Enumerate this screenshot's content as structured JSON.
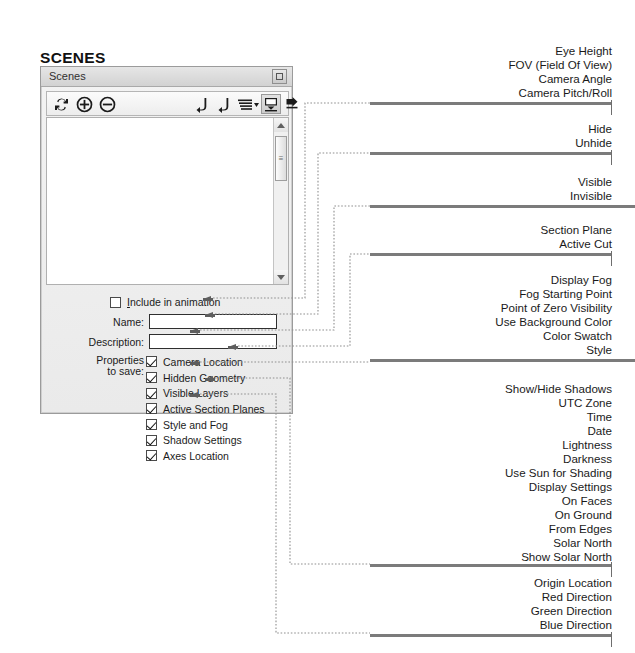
{
  "page": {
    "heading": "SCENES",
    "accent_bar_color": "#7b7b7b",
    "dotted_line_color": "#8f8f8f"
  },
  "dialog": {
    "title": "Scenes",
    "close_label": "",
    "toolbar": {
      "icons": [
        {
          "name": "update-scene-icon",
          "glyph": "refresh"
        },
        {
          "name": "add-scene-icon",
          "glyph": "plus-circle"
        },
        {
          "name": "remove-scene-icon",
          "glyph": "minus-circle"
        },
        {
          "name": "move-scene-up-icon",
          "glyph": "arrow-up-left"
        },
        {
          "name": "move-scene-down-icon",
          "glyph": "arrow-up-right"
        },
        {
          "name": "view-options-icon",
          "glyph": "list-dropdown"
        },
        {
          "name": "show-details-icon",
          "glyph": "details-panel"
        },
        {
          "name": "expand-panel-icon",
          "glyph": "arrow-right-box"
        }
      ]
    },
    "scrollbar": {
      "thumb_glyph": "≡"
    },
    "include_in_animation": {
      "label_prefix": "I",
      "label_rest": "nclude in animation",
      "checked": false
    },
    "fields": [
      {
        "label": "Name:",
        "value": "",
        "placeholder": ""
      },
      {
        "label": "Description:",
        "value": "",
        "placeholder": ""
      }
    ],
    "properties_to_save_label_line1": "Properties",
    "properties_to_save_label_line2": "to save:",
    "properties": [
      {
        "label": "Camera Location",
        "checked": true
      },
      {
        "label": "Hidden Geometry",
        "checked": true
      },
      {
        "label": "Visible Layers",
        "checked": true
      },
      {
        "label": "Active Section Planes",
        "checked": true
      },
      {
        "label": "Style and Fog",
        "checked": true
      },
      {
        "label": "Shadow Settings",
        "checked": true
      },
      {
        "label": "Axes Location",
        "checked": true
      }
    ]
  },
  "annotations": [
    {
      "key": "camera-location",
      "items": [
        "Eye Height",
        "FOV (Field Of View)",
        "Camera Angle",
        "Camera Pitch/Roll"
      ]
    },
    {
      "key": "hidden-geometry",
      "items": [
        "Hide",
        "Unhide"
      ]
    },
    {
      "key": "visible-layers",
      "items": [
        "Visible",
        "Invisible"
      ]
    },
    {
      "key": "active-section-planes",
      "items": [
        "Section Plane",
        "Active Cut"
      ]
    },
    {
      "key": "style-and-fog",
      "items": [
        "Display Fog",
        "Fog Starting Point",
        "Point of Zero Visibility",
        "Use Background Color",
        "Color Swatch",
        "Style"
      ]
    },
    {
      "key": "shadow-settings",
      "items": [
        "Show/Hide Shadows",
        "UTC Zone",
        "Time",
        "Date",
        "Lightness",
        "Darkness",
        "Use Sun for Shading",
        "Display Settings",
        "On Faces",
        "On Ground",
        "From Edges",
        "Solar North",
        "Show Solar North"
      ]
    },
    {
      "key": "axes-location",
      "items": [
        "Origin Location",
        "Red Direction",
        "Green Direction",
        "Blue Direction"
      ]
    }
  ]
}
